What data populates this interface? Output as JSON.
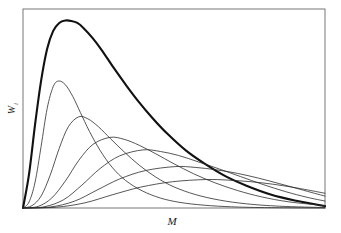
{
  "figure": {
    "background_color": "#ffffff",
    "frame_color": "#777777",
    "curve_color": "#2b2b2b",
    "envelope_color": "#111111",
    "frame": {
      "x0": 23,
      "y0": 9,
      "x1": 325,
      "y1": 208
    }
  },
  "axes": {
    "x_label": "M",
    "y_label": "W",
    "y_label_subscript": "i",
    "x_label_pos": {
      "x": 172,
      "y": 225
    },
    "y_label_pos": {
      "x": 15,
      "y": 110
    },
    "ticks": [],
    "gridlines": false
  },
  "chart_data": {
    "type": "line",
    "title": "",
    "subtitle": "",
    "xlabel": "M",
    "ylabel": "W",
    "xlim": [
      0,
      1
    ],
    "ylim": [
      0,
      1
    ],
    "grid": false,
    "legend": "none",
    "annotations": [],
    "series": [
      {
        "name": "envelope",
        "style": "bold",
        "line_width": 2.1,
        "peak_x": 0.18,
        "peak_y": 0.94,
        "shape": "log-normal",
        "sigma": 0.62,
        "x": [
          0.0,
          0.02,
          0.04,
          0.06,
          0.08,
          0.1,
          0.12,
          0.14,
          0.16,
          0.18,
          0.2,
          0.23,
          0.26,
          0.3,
          0.34,
          0.38,
          0.43,
          0.48,
          0.54,
          0.6,
          0.67,
          0.74,
          0.82,
          0.9,
          1.0
        ],
        "y": [
          0.0,
          0.17,
          0.42,
          0.64,
          0.8,
          0.89,
          0.93,
          0.942,
          0.94,
          0.93,
          0.905,
          0.855,
          0.795,
          0.705,
          0.62,
          0.54,
          0.45,
          0.37,
          0.288,
          0.224,
          0.16,
          0.112,
          0.068,
          0.038,
          0.01
        ]
      },
      {
        "name": "component-1",
        "style": "thin",
        "line_width": 0.8,
        "peak_x": 0.118,
        "peak_y": 0.638,
        "shape": "log-normal",
        "sigma": 0.3,
        "x": [
          0.0,
          0.02,
          0.04,
          0.06,
          0.08,
          0.1,
          0.118,
          0.14,
          0.165,
          0.19,
          0.22,
          0.255,
          0.295,
          0.34,
          0.395,
          0.455,
          0.52,
          0.6,
          0.69,
          0.8,
          1.0
        ],
        "y": [
          0.0,
          0.03,
          0.13,
          0.31,
          0.5,
          0.61,
          0.638,
          0.62,
          0.56,
          0.48,
          0.385,
          0.29,
          0.205,
          0.138,
          0.086,
          0.05,
          0.028,
          0.014,
          0.006,
          0.002,
          0.0
        ]
      },
      {
        "name": "component-2",
        "style": "thin",
        "line_width": 0.8,
        "peak_x": 0.184,
        "peak_y": 0.458,
        "shape": "log-normal",
        "sigma": 0.32,
        "x": [
          0.0,
          0.03,
          0.06,
          0.09,
          0.12,
          0.15,
          0.184,
          0.215,
          0.25,
          0.29,
          0.335,
          0.385,
          0.44,
          0.5,
          0.57,
          0.65,
          0.74,
          0.85,
          1.0
        ],
        "y": [
          0.0,
          0.012,
          0.06,
          0.165,
          0.3,
          0.408,
          0.458,
          0.448,
          0.408,
          0.348,
          0.282,
          0.215,
          0.155,
          0.106,
          0.068,
          0.04,
          0.021,
          0.009,
          0.002
        ]
      },
      {
        "name": "component-3",
        "style": "thin",
        "line_width": 0.8,
        "peak_x": 0.288,
        "peak_y": 0.355,
        "shape": "log-normal",
        "sigma": 0.34,
        "x": [
          0.0,
          0.05,
          0.095,
          0.14,
          0.185,
          0.232,
          0.288,
          0.335,
          0.385,
          0.44,
          0.5,
          0.565,
          0.635,
          0.71,
          0.79,
          0.88,
          1.0
        ],
        "y": [
          0.0,
          0.008,
          0.05,
          0.135,
          0.24,
          0.32,
          0.355,
          0.345,
          0.315,
          0.272,
          0.222,
          0.172,
          0.127,
          0.088,
          0.056,
          0.031,
          0.012
        ]
      },
      {
        "name": "component-4",
        "style": "thin",
        "line_width": 0.8,
        "peak_x": 0.397,
        "peak_y": 0.292,
        "shape": "log-normal",
        "sigma": 0.36,
        "x": [
          0.0,
          0.07,
          0.135,
          0.195,
          0.255,
          0.32,
          0.397,
          0.455,
          0.515,
          0.58,
          0.65,
          0.72,
          0.795,
          0.87,
          0.94,
          1.0
        ],
        "y": [
          0.0,
          0.006,
          0.042,
          0.115,
          0.198,
          0.262,
          0.292,
          0.284,
          0.264,
          0.232,
          0.196,
          0.158,
          0.118,
          0.082,
          0.054,
          0.035
        ]
      },
      {
        "name": "component-5",
        "style": "thin",
        "line_width": 0.8,
        "peak_x": 0.503,
        "peak_y": 0.208,
        "shape": "log-normal",
        "sigma": 0.38,
        "x": [
          0.0,
          0.09,
          0.17,
          0.245,
          0.32,
          0.405,
          0.503,
          0.57,
          0.64,
          0.71,
          0.78,
          0.85,
          0.915,
          0.965,
          1.0
        ],
        "y": [
          0.0,
          0.005,
          0.034,
          0.09,
          0.146,
          0.188,
          0.208,
          0.204,
          0.192,
          0.174,
          0.15,
          0.122,
          0.095,
          0.074,
          0.06
        ]
      },
      {
        "name": "component-6",
        "style": "thin",
        "line_width": 0.8,
        "peak_x": 0.605,
        "peak_y": 0.143,
        "shape": "log-normal",
        "sigma": 0.4,
        "x": [
          0.0,
          0.11,
          0.205,
          0.295,
          0.39,
          0.495,
          0.605,
          0.68,
          0.755,
          0.825,
          0.89,
          0.945,
          1.0
        ],
        "y": [
          0.0,
          0.004,
          0.026,
          0.066,
          0.105,
          0.132,
          0.143,
          0.14,
          0.132,
          0.12,
          0.105,
          0.09,
          0.074
        ]
      }
    ]
  }
}
